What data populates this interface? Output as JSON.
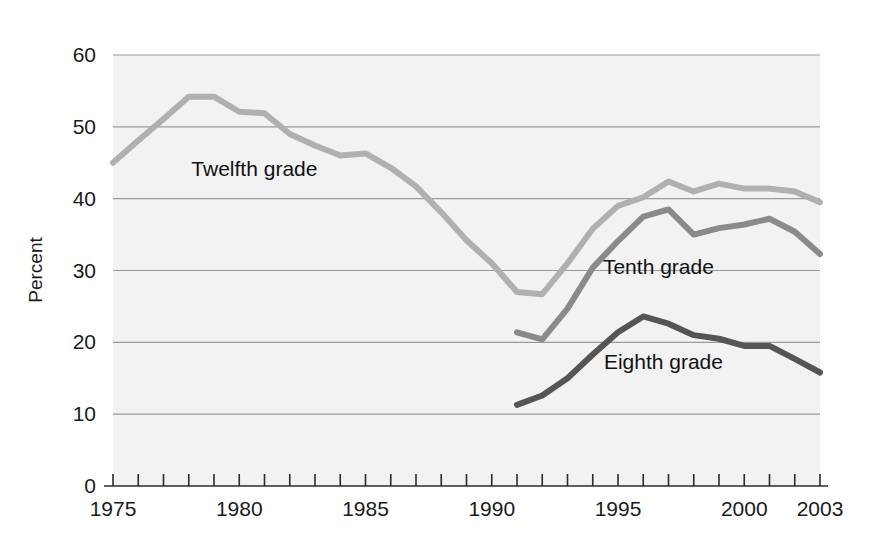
{
  "chart_data": {
    "type": "line",
    "title": "",
    "xlabel": "",
    "ylabel": "Percent",
    "xlim": [
      1975,
      2003
    ],
    "ylim": [
      0,
      60
    ],
    "grid": true,
    "legend_position": "inline-labels",
    "y_ticks": [
      "0",
      "10",
      "20",
      "30",
      "40",
      "50",
      "60"
    ],
    "y_tick_values": [
      0,
      10,
      20,
      30,
      40,
      50,
      60
    ],
    "x_tick_labels": [
      "1975",
      "1980",
      "1985",
      "1990",
      "1995",
      "2000",
      "2003"
    ],
    "x_tick_label_values": [
      1975,
      1980,
      1985,
      1990,
      1995,
      2000,
      2003
    ],
    "x_minor_ticks": [
      1975,
      1976,
      1977,
      1978,
      1979,
      1980,
      1981,
      1982,
      1983,
      1984,
      1985,
      1986,
      1987,
      1988,
      1989,
      1990,
      1991,
      1992,
      1993,
      1994,
      1995,
      1996,
      1997,
      1998,
      1999,
      2000,
      2001,
      2002,
      2003
    ],
    "series": [
      {
        "name": "Twelfth grade",
        "color": "#b0b0b0",
        "label_x": 1980.6,
        "label_y": 43.2,
        "x": [
          1975,
          1976,
          1977,
          1978,
          1979,
          1980,
          1981,
          1982,
          1983,
          1984,
          1985,
          1986,
          1987,
          1988,
          1989,
          1990,
          1991,
          1992,
          1993,
          1994,
          1995,
          1996,
          1997,
          1998,
          1999,
          2000,
          2001,
          2002,
          2003
        ],
        "values": [
          45.0,
          48.1,
          51.1,
          54.2,
          54.2,
          52.1,
          51.9,
          49.0,
          47.4,
          46.0,
          46.3,
          44.3,
          41.7,
          38.1,
          34.2,
          31.0,
          27.0,
          26.7,
          31.0,
          35.8,
          39.0,
          40.2,
          42.4,
          41.0,
          42.1,
          41.4,
          41.4,
          41.0,
          39.5
        ]
      },
      {
        "name": "Tenth grade",
        "color": "#8a8a8a",
        "label_x": 1996.6,
        "label_y": 29.5,
        "x": [
          1991,
          1992,
          1993,
          1994,
          1995,
          1996,
          1997,
          1998,
          1999,
          2000,
          2001,
          2002,
          2003
        ],
        "values": [
          21.4,
          20.4,
          24.7,
          30.4,
          34.1,
          37.5,
          38.5,
          35.0,
          35.9,
          36.4,
          37.2,
          35.4,
          32.3
        ]
      },
      {
        "name": "Eighth grade",
        "color": "#555555",
        "label_x": 1996.8,
        "label_y": 16.3,
        "x": [
          1991,
          1992,
          1993,
          1994,
          1995,
          1996,
          1997,
          1998,
          1999,
          2000,
          2001,
          2002,
          2003
        ],
        "values": [
          11.3,
          12.6,
          15.0,
          18.3,
          21.4,
          23.6,
          22.6,
          21.0,
          20.5,
          19.5,
          19.5,
          17.7,
          15.8
        ]
      }
    ]
  }
}
